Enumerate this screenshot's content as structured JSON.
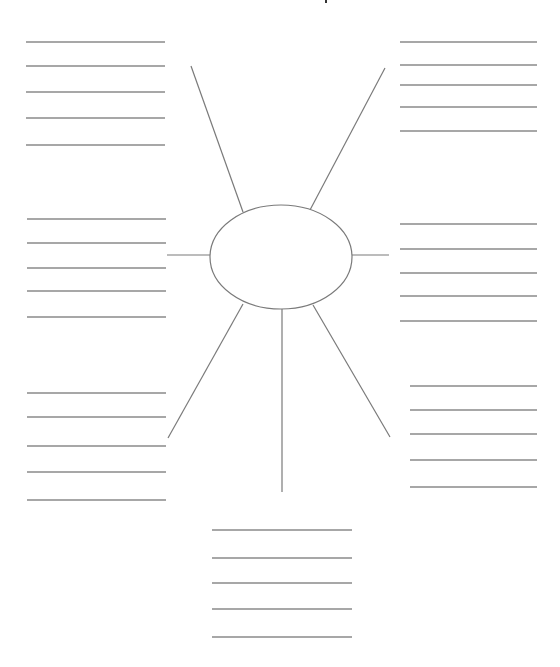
{
  "diagram": {
    "type": "spider-map graphic organizer",
    "background": "#ffffff",
    "stroke_color": "#7a7a7a",
    "writing_line_color": "#8a8a8a",
    "top_artifact": {
      "x": 325,
      "y": 0,
      "w": 2,
      "h": 3,
      "color": "#333333"
    },
    "center_oval": {
      "cx": 281,
      "cy": 257,
      "rx": 71,
      "ry": 52,
      "label": ""
    },
    "spokes": [
      {
        "name": "spoke-upper-left",
        "x1": 243,
        "y1": 212,
        "x2": 191,
        "y2": 66
      },
      {
        "name": "spoke-upper-right",
        "x1": 310,
        "y1": 210,
        "x2": 385,
        "y2": 68
      },
      {
        "name": "spoke-left",
        "x1": 210,
        "y1": 255,
        "x2": 167,
        "y2": 255
      },
      {
        "name": "spoke-right",
        "x1": 352,
        "y1": 255,
        "x2": 389,
        "y2": 255
      },
      {
        "name": "spoke-lower-left",
        "x1": 243,
        "y1": 304,
        "x2": 168,
        "y2": 438
      },
      {
        "name": "spoke-bottom",
        "x1": 282,
        "y1": 309,
        "x2": 282,
        "y2": 492
      },
      {
        "name": "spoke-lower-right",
        "x1": 313,
        "y1": 305,
        "x2": 390,
        "y2": 437
      }
    ],
    "line_groups": [
      {
        "name": "lines-top-left",
        "x1": 26,
        "x2": 165,
        "ys": [
          42,
          66,
          92,
          118,
          145
        ],
        "text": [
          "",
          "",
          "",
          "",
          ""
        ]
      },
      {
        "name": "lines-top-right",
        "x1": 400,
        "x2": 537,
        "ys": [
          42,
          65,
          85,
          107,
          131
        ],
        "text": [
          "",
          "",
          "",
          "",
          ""
        ]
      },
      {
        "name": "lines-middle-left",
        "x1": 27,
        "x2": 166,
        "ys": [
          219,
          243,
          268,
          291,
          317
        ],
        "text": [
          "",
          "",
          "",
          "",
          ""
        ]
      },
      {
        "name": "lines-middle-right",
        "x1": 400,
        "x2": 537,
        "ys": [
          224,
          249,
          273,
          296,
          321
        ],
        "text": [
          "",
          "",
          "",
          "",
          ""
        ]
      },
      {
        "name": "lines-lower-left",
        "x1": 27,
        "x2": 166,
        "ys": [
          393,
          417,
          446,
          472,
          500
        ],
        "text": [
          "",
          "",
          "",
          "",
          ""
        ]
      },
      {
        "name": "lines-lower-right",
        "x1": 410,
        "x2": 537,
        "ys": [
          386,
          410,
          434,
          460,
          487
        ],
        "text": [
          "",
          "",
          "",
          "",
          ""
        ]
      },
      {
        "name": "lines-bottom",
        "x1": 212,
        "x2": 352,
        "ys": [
          530,
          558,
          583,
          609,
          637
        ],
        "text": [
          "",
          "",
          "",
          "",
          ""
        ]
      }
    ]
  }
}
